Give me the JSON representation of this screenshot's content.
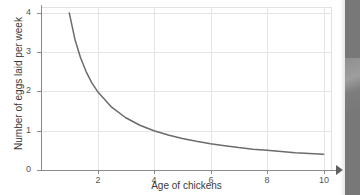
{
  "chart_data": {
    "type": "line",
    "title": "",
    "xlabel": "Age of chickens",
    "ylabel": "Number of eggs laid per week",
    "xlim": [
      0,
      10.3
    ],
    "ylim": [
      0,
      4.15
    ],
    "xticks": [
      "2",
      "4",
      "6",
      "8",
      "10"
    ],
    "xtick_values": [
      2,
      4,
      6,
      8,
      10
    ],
    "yticks": [
      "0",
      "1",
      "2",
      "3",
      "4"
    ],
    "ytick_values": [
      0,
      1,
      2,
      3,
      4
    ],
    "grid": true,
    "legend": "none",
    "relationship": "y = 4 / x  (inverse proportion)",
    "series": [
      {
        "name": "Eggs laid per week",
        "color": "#6b6b6b",
        "x": [
          1.0,
          1.2,
          1.4,
          1.6,
          1.8,
          2.0,
          2.5,
          3.0,
          3.5,
          4.0,
          4.5,
          5.0,
          5.5,
          6.0,
          6.5,
          7.0,
          7.5,
          8.0,
          8.5,
          9.0,
          9.5,
          10.0
        ],
        "values": [
          4.0,
          3.33,
          2.86,
          2.5,
          2.22,
          2.0,
          1.6,
          1.33,
          1.14,
          1.0,
          0.89,
          0.8,
          0.73,
          0.67,
          0.62,
          0.57,
          0.53,
          0.5,
          0.47,
          0.44,
          0.42,
          0.4
        ]
      }
    ]
  },
  "axes": {
    "x_arrow": "arrow-right"
  },
  "colors": {
    "curve": "#6b6b6b",
    "grid": "#e4e4e4",
    "axis": "#8a8a8a",
    "text": "#3a3a3a",
    "edge_artifact": "#787878"
  }
}
